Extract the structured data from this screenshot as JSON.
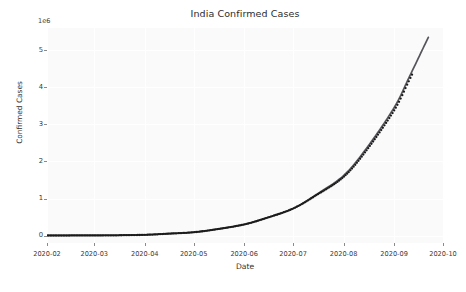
{
  "chart_data": {
    "type": "line",
    "title": "India Confirmed Cases",
    "xlabel": "Date",
    "ylabel": "Confirmed Cases",
    "y_offset_text": "1e6",
    "y_offset_multiplier": 1000000,
    "xlim": [
      "2020-02-01",
      "2020-10-01"
    ],
    "ylim": [
      -0.2,
      5.6
    ],
    "grid": true,
    "grid_color": "#ffffff",
    "legend": "none",
    "x_tick_labels": [
      "2020-02",
      "2020-03",
      "2020-04",
      "2020-05",
      "2020-06",
      "2020-07",
      "2020-08",
      "2020-09",
      "2020-10"
    ],
    "y_tick_labels": [
      "0",
      "1",
      "2",
      "3",
      "4",
      "5"
    ],
    "y_tick_values": [
      0,
      1,
      2,
      3,
      4,
      5
    ],
    "series": [
      {
        "name": "fitted curve",
        "type": "line",
        "color": "#55555a",
        "linewidth": 1.6,
        "x": [
          "2020-02-01",
          "2020-02-15",
          "2020-03-01",
          "2020-03-15",
          "2020-04-01",
          "2020-04-15",
          "2020-05-01",
          "2020-05-15",
          "2020-06-01",
          "2020-06-15",
          "2020-07-01",
          "2020-07-15",
          "2020-08-01",
          "2020-08-15",
          "2020-09-01",
          "2020-09-10",
          "2020-09-22"
        ],
        "values": [
          0.002,
          0.003,
          0.005,
          0.008,
          0.02,
          0.05,
          0.09,
          0.17,
          0.3,
          0.48,
          0.73,
          1.1,
          1.62,
          2.35,
          3.45,
          4.25,
          5.35
        ]
      },
      {
        "name": "observed data points",
        "type": "scatter",
        "color": "#1a1a1a",
        "marker": "o",
        "markersize": 1.4,
        "x": [
          "2020-02-01",
          "2020-03-01",
          "2020-04-01",
          "2020-05-01",
          "2020-06-01",
          "2020-07-01",
          "2020-08-01",
          "2020-08-15",
          "2020-09-01",
          "2020-09-12"
        ],
        "values": [
          0.0,
          0.003,
          0.02,
          0.08,
          0.3,
          0.73,
          1.7,
          2.5,
          3.7,
          4.75
        ]
      }
    ]
  },
  "axes": {
    "title": "India Confirmed Cases",
    "x_title": "Date",
    "y_title": "Confirmed Cases",
    "y_offset": "1e6"
  }
}
